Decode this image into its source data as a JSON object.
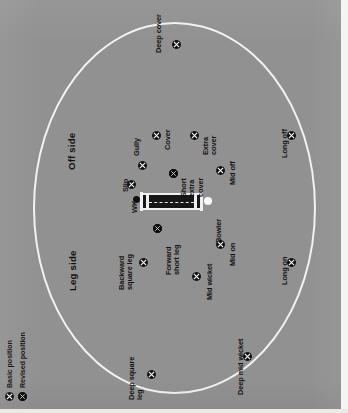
{
  "diagram": {
    "orientation": "rotated-90-ccw",
    "background_color": "#919191",
    "boundary_color": "#f2f2f0",
    "pitch_color": "#171717",
    "label_color": "#111111"
  },
  "sides": {
    "off": "Off side",
    "leg": "Leg side"
  },
  "pitch": {
    "keeper_label": "WK",
    "bowler_label": "Bowler"
  },
  "legend": {
    "items": [
      {
        "label": "Basic position",
        "marker": "x-circle-open",
        "color": "#111111"
      },
      {
        "label": "Revised position",
        "marker": "x-circle-filled",
        "color": "#111111"
      }
    ]
  },
  "fielders": [
    {
      "id": "deep-cover",
      "label": "Deep cover",
      "type": "basic"
    },
    {
      "id": "cover",
      "label": "Cover",
      "type": "basic"
    },
    {
      "id": "extra-cover",
      "label": "Extra\ncover",
      "type": "basic"
    },
    {
      "id": "short-extra-cover",
      "label": "Short\nextra\ncover",
      "type": "revised"
    },
    {
      "id": "gully",
      "label": "Gully",
      "type": "basic"
    },
    {
      "id": "slip",
      "label": "Slip",
      "type": "basic"
    },
    {
      "id": "mid-off",
      "label": "Mid off",
      "type": "basic"
    },
    {
      "id": "long-off",
      "label": "Long off",
      "type": "basic"
    },
    {
      "id": "forward-short-leg",
      "label": "Forward\nshort leg",
      "type": "revised"
    },
    {
      "id": "backward-square-leg",
      "label": "Backward\nsquare leg",
      "type": "basic"
    },
    {
      "id": "mid-wicket",
      "label": "Mid wicket",
      "type": "basic"
    },
    {
      "id": "mid-on",
      "label": "Mid on",
      "type": "basic"
    },
    {
      "id": "long-on",
      "label": "Long on",
      "type": "basic"
    },
    {
      "id": "deep-square-leg",
      "label": "Deep square\nleg",
      "type": "basic"
    },
    {
      "id": "deep-mid-wicket",
      "label": "Deep mid wicket",
      "type": "basic"
    }
  ],
  "labels": {
    "deep_cover": "Deep cover",
    "cover": "Cover",
    "extra_cover": "Extra\ncover",
    "short_extra_cover": "Short\nextra\ncover",
    "gully": "Gully",
    "slip": "Slip",
    "mid_off": "Mid off",
    "long_off": "Long off",
    "forward_short_leg": "Forward\nshort leg",
    "backward_square_leg": "Backward\nsquare leg",
    "mid_wicket": "Mid wicket",
    "mid_on": "Mid on",
    "long_on": "Long on",
    "deep_square_leg": "Deep square\nleg",
    "deep_mid_wicket": "Deep mid wicket",
    "wk": "WK",
    "bowler": "Bowler",
    "off_side": "Off side",
    "leg_side": "Leg side",
    "legend_basic": "Basic position",
    "legend_revised": "Revised position"
  }
}
